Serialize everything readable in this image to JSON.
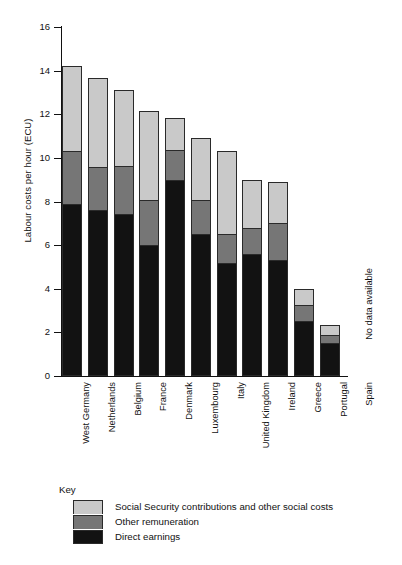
{
  "chart_data": {
    "type": "bar",
    "subtype": "stacked-vertical",
    "title": "",
    "xlabel": "",
    "ylabel": "Labour costs per hour (ECU)",
    "ylim": [
      0,
      16
    ],
    "yticks": [
      0,
      2,
      4,
      6,
      8,
      10,
      12,
      14,
      16
    ],
    "ytick_labels": [
      "0",
      "2",
      "4",
      "6",
      "8",
      "10",
      "12",
      "14",
      "16"
    ],
    "grid": false,
    "legend_position": "below-plot",
    "categories": [
      "West Germany",
      "Netherlands",
      "Belgium",
      "France",
      "Denmark",
      "Luxembourg",
      "Italy",
      "United Kingdom",
      "Ireland",
      "Greece",
      "Portugal",
      "Spain"
    ],
    "series": [
      {
        "name": "Direct earnings",
        "color": "#121212",
        "values": [
          7.9,
          7.6,
          7.45,
          6.0,
          9.0,
          6.5,
          5.2,
          5.6,
          5.3,
          2.5,
          1.5,
          null
        ]
      },
      {
        "name": "Other remuneration",
        "color": "#767676",
        "values": [
          2.4,
          2.0,
          2.2,
          2.05,
          1.35,
          1.55,
          1.3,
          1.2,
          1.7,
          0.75,
          0.4,
          null
        ]
      },
      {
        "name": "Social Security contributions and other social costs",
        "color": "#c9c9c9",
        "values": [
          3.9,
          4.05,
          3.45,
          4.1,
          1.5,
          2.85,
          3.8,
          2.2,
          1.9,
          0.75,
          0.45,
          null
        ]
      }
    ],
    "totals": [
      14.2,
      13.65,
      13.1,
      12.15,
      11.85,
      10.9,
      10.3,
      9.0,
      8.9,
      4.0,
      2.35,
      null
    ],
    "annotations": [
      {
        "category": "Spain",
        "text": "No data available"
      }
    ]
  },
  "axis": {
    "y_title": "Labour costs per hour (ECU)"
  },
  "key": {
    "title": "Key",
    "items": [
      {
        "label": "Social Security contributions and other social costs",
        "color": "#c9c9c9"
      },
      {
        "label": "Other remuneration",
        "color": "#767676"
      },
      {
        "label": "Direct earnings",
        "color": "#121212"
      }
    ]
  }
}
